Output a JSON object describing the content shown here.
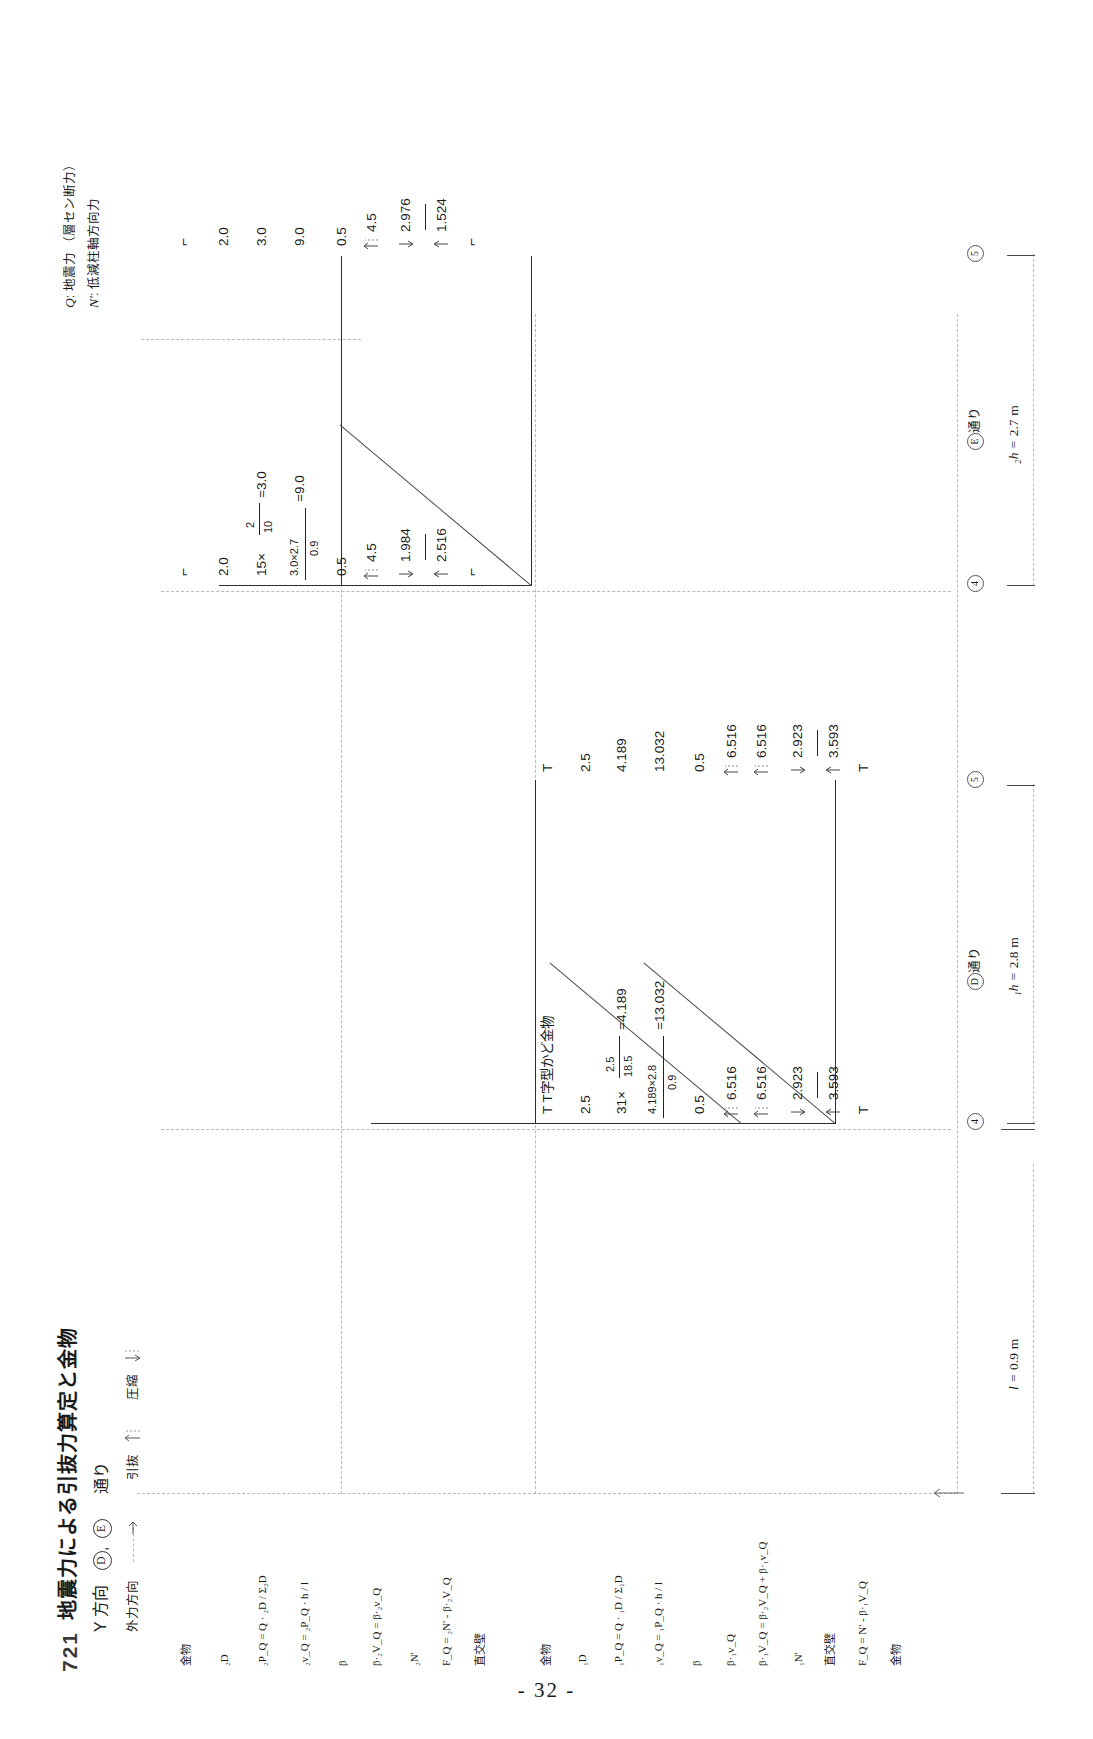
{
  "page": {
    "number": "- 32 -"
  },
  "header": {
    "section_number": "721",
    "title": "地震力による引抜力算定と金物",
    "direction_label": "Y 方向",
    "axis_labels": [
      "D",
      "E"
    ],
    "axis_suffix": "通り",
    "load_direction_label": "外力方向",
    "legend_uplift": "引抜",
    "legend_compression": "圧縮"
  },
  "legend": {
    "q_symbol": "Q",
    "q_desc": ": 地震力 （層セン断力）",
    "n_symbol": "N'",
    "n_desc": ": 低減柱軸方向力"
  },
  "row_labels": [
    "金物",
    "₂D",
    "₂P_Q = Q · ₂D / Σ₂D",
    "₂v_Q = ₂P_Q · h / l",
    "β",
    "β·₂V_Q = β·₂v_Q",
    "₂N'",
    "F_Q = ₂N' - β·₂V_Q",
    "直交壁",
    "金物",
    "₁D",
    "₁P_Q = Q · ₁D / Σ₁D",
    "₁v_Q = ₁P_Q · h / l",
    "β",
    "β·₁v_Q",
    "β·₁V_Q = β·₂V_Q + β·₁v_Q",
    "₁N'",
    "直交壁",
    "F_Q = N' - β·₁V_Q",
    "金物"
  ],
  "upper_story": {
    "span_label": "E通り",
    "grid_left": "4",
    "grid_right": "5",
    "calc_column": {
      "hardware_top": "⌐",
      "D_value": "2.0",
      "pq_expr_a": "15×",
      "pq_frac_num": "2",
      "pq_frac_den": "10",
      "pq_result": "=3.0",
      "vq_frac_num": "3.0×2.7",
      "vq_frac_den": "0.9",
      "vq_result": "=9.0",
      "beta": "0.5",
      "beta_v": "4.5",
      "n_prime": "1.984",
      "f_q": "2.516",
      "hardware_bottom": "⌐"
    },
    "result_column": {
      "hardware_top": "⌐",
      "D_value": "2.0",
      "pq": "3.0",
      "vq": "9.0",
      "beta": "0.5",
      "beta_v": "4.5",
      "n_prime": "2.976",
      "f_q": "1.524",
      "hardware_bottom": "⌐"
    }
  },
  "lower_story": {
    "span_label": "D通り",
    "grid_left": "4",
    "grid_right": "5",
    "calc_column": {
      "hardware_top": "T",
      "hardware_note": "T T字型かど金物",
      "D_value": "2.5",
      "pq_expr_a": "31×",
      "pq_frac_num": "2.5",
      "pq_frac_den": "18.5",
      "pq_result": "=4.189",
      "vq_frac_num": "4.189×2.8",
      "vq_frac_den": "0.9",
      "vq_result": "=13.032",
      "beta": "0.5",
      "beta_v1": "6.516",
      "beta_v2": "6.516",
      "n_prime": "2.923",
      "f_q": "3.593",
      "hardware_bottom": "T"
    },
    "result_column": {
      "hardware_top": "T",
      "D_value": "2.5",
      "pq": "4.189",
      "vq": "13.032",
      "beta": "0.5",
      "beta_v1": "6.516",
      "beta_v2": "6.516",
      "n_prime": "2.923",
      "f_q": "3.593",
      "hardware_bottom": "T"
    }
  },
  "dimensions": {
    "l_symbol": "l =",
    "l_value": "0.9",
    "l_unit": "m",
    "h2_symbol": "₂h =",
    "h2_value": "2.7",
    "h2_unit": "m",
    "h1_symbol": "₁h =",
    "h1_value": "2.8",
    "h1_unit": "m"
  }
}
